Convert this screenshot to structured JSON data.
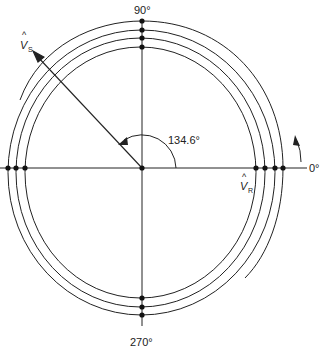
{
  "diagram": {
    "colors": {
      "line": "#222222",
      "background": "#ffffff"
    },
    "center": {
      "x": 142,
      "y": 168
    },
    "axes": {
      "top_label": "90°",
      "bottom_label": "270°",
      "right_label": "0°"
    },
    "vectors": {
      "vs": {
        "symbol": "V",
        "hat": "^",
        "subscript": "S",
        "angle_deg": 134.6
      },
      "vr": {
        "symbol": "V",
        "hat": "^",
        "subscript": "R",
        "angle_deg": 0
      }
    },
    "angle_label": "134.6°",
    "rotation_direction": "counterclockwise",
    "curves": [
      {
        "name": "ellipse-1",
        "cx": 140.5,
        "cy": 172.5,
        "rx": 115.5,
        "ry": 125.5
      },
      {
        "name": "ellipse-2",
        "cx": 140.5,
        "cy": 172.5,
        "rx": 124.5,
        "ry": 134.5
      },
      {
        "name": "ellipse-3",
        "cx": 141.5,
        "cy": 172.5,
        "rx": 133.5,
        "ry": 142.5
      },
      {
        "name": "outer-arc-4",
        "top_y": 21,
        "right_x": 283
      }
    ],
    "intersection_points": {
      "top": [
        21,
        30,
        38,
        47
      ],
      "right": [
        256,
        265,
        275,
        283
      ],
      "left": [
        8,
        16,
        25
      ],
      "bottom": [
        298,
        307,
        315
      ]
    }
  }
}
